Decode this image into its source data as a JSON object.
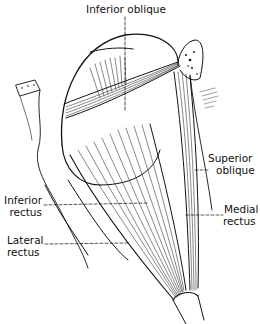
{
  "figure": {
    "labels": {
      "inferior_oblique": "Inferior oblique",
      "superior_oblique_1": "Superior",
      "superior_oblique_2": "oblique",
      "inferior_rectus_1": "Inferior",
      "inferior_rectus_2": "rectus",
      "medial_rectus_1": "Medial",
      "medial_rectus_2": "rectus",
      "lateral_rectus_1": "Lateral",
      "lateral_rectus_2": "rectus"
    },
    "colors": {
      "ink": "#111111",
      "background": "#ffffff"
    }
  }
}
